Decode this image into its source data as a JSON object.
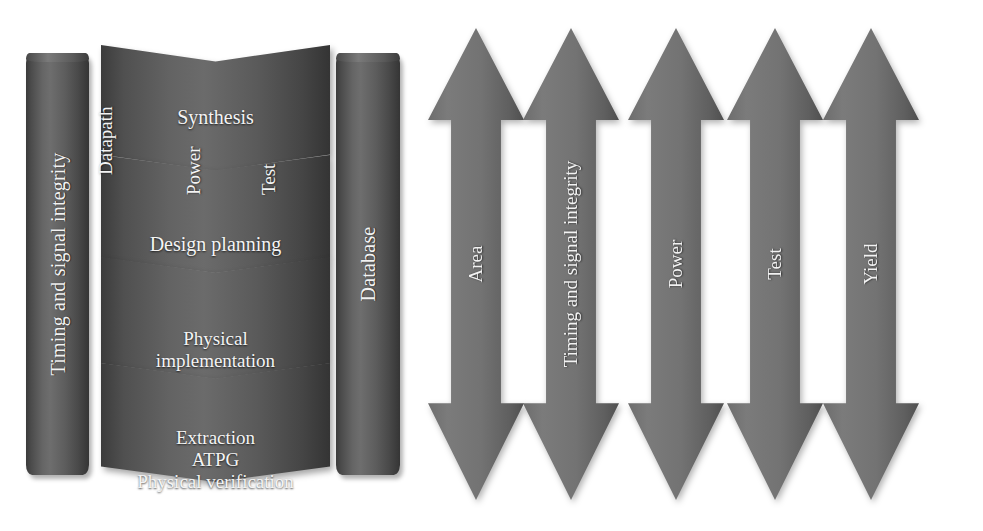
{
  "diagram": {
    "left_cylinder": {
      "name": "timing-and-signal-integrity-cylinder",
      "label": "Timing and signal integrity"
    },
    "right_cylinder": {
      "name": "database-cylinder",
      "label": "Database"
    },
    "flow_stages": [
      {
        "id": "synthesis",
        "title": "Synthesis",
        "sub_labels": [
          "Datapath",
          "Power",
          "Test"
        ]
      },
      {
        "id": "design-planning",
        "title": "Design planning",
        "sub_labels": []
      },
      {
        "id": "physical-implementation",
        "title_line_1": "Physical",
        "title_line_2": "implementation",
        "sub_labels": []
      },
      {
        "id": "extraction-atpg-verification",
        "title_line_1": "Extraction",
        "title_line_2": "ATPG",
        "title_line_3": "Physical verification",
        "sub_labels": []
      }
    ],
    "arrows": [
      {
        "id": "area",
        "label": "Area"
      },
      {
        "id": "timing",
        "label": "Timing and signal integrity"
      },
      {
        "id": "power",
        "label": "Power"
      },
      {
        "id": "test",
        "label": "Test"
      },
      {
        "id": "yield",
        "label": "Yield"
      }
    ],
    "colors": {
      "fill_dark": "#3c3c3c",
      "fill_mid": "#6b6b6b",
      "arrow_fill": "#757575",
      "text": "#f2f2f2",
      "background": "#ffffff"
    }
  }
}
